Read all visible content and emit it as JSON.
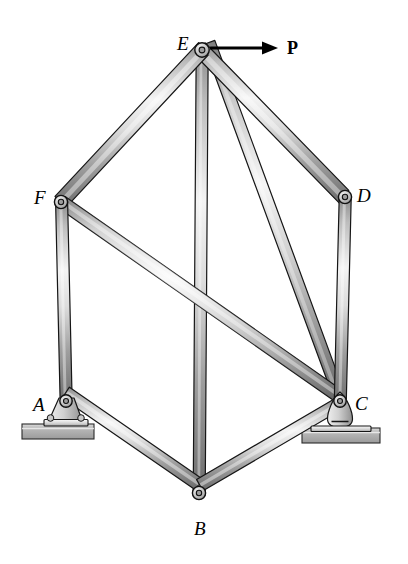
{
  "figure": {
    "type": "engineering-truss-diagram",
    "background_color": "#ffffff",
    "width": 408,
    "height": 564
  },
  "joints": [
    {
      "id": "A",
      "label": "A",
      "x": 66,
      "y": 403,
      "label_x": 33,
      "label_y": 395,
      "support": "pin"
    },
    {
      "id": "B",
      "label": "B",
      "x": 199,
      "y": 495,
      "label_x": 194,
      "label_y": 519,
      "support": "none"
    },
    {
      "id": "C",
      "label": "C",
      "x": 340,
      "y": 405,
      "label_x": 355,
      "label_y": 394,
      "support": "rocker"
    },
    {
      "id": "D",
      "label": "D",
      "x": 345,
      "y": 197,
      "label_x": 357,
      "label_y": 186,
      "support": "none"
    },
    {
      "id": "E",
      "label": "E",
      "x": 202,
      "y": 50,
      "label_x": 177,
      "label_y": 34,
      "support": "none"
    },
    {
      "id": "F",
      "label": "F",
      "x": 61,
      "y": 202,
      "label_x": 34,
      "label_y": 188,
      "support": "none"
    }
  ],
  "members": [
    {
      "id": "EF",
      "from": "E",
      "to": "F",
      "width": 13
    },
    {
      "id": "ED",
      "from": "E",
      "to": "D",
      "width": 13
    },
    {
      "id": "EB",
      "from": "E",
      "to": "B",
      "width": 12
    },
    {
      "id": "EC",
      "from": "E",
      "to": "C",
      "width": 12
    },
    {
      "id": "FA",
      "from": "F",
      "to": "A",
      "width": 12
    },
    {
      "id": "FC",
      "from": "F",
      "to": "C",
      "width": 13
    },
    {
      "id": "DC",
      "from": "D",
      "to": "C",
      "width": 12
    },
    {
      "id": "AB",
      "from": "A",
      "to": "B",
      "width": 12
    },
    {
      "id": "BC",
      "from": "B",
      "to": "C",
      "width": 12
    }
  ],
  "load": {
    "name": "P",
    "label": "P",
    "applied_at": "E",
    "direction": "horizontal-right",
    "arrow_start_x": 210,
    "arrow_start_y": 48,
    "arrow_end_x": 277,
    "arrow_end_y": 48,
    "label_x": 287,
    "label_y": 39
  },
  "supports": [
    {
      "at": "A",
      "kind": "pin",
      "ground_x": 22,
      "ground_y": 424,
      "ground_width": 72,
      "ground_height": 15
    },
    {
      "at": "C",
      "kind": "rocker",
      "ground_x": 302,
      "ground_y": 428,
      "ground_width": 78,
      "ground_height": 15
    }
  ],
  "colors": {
    "outline": "#111111",
    "bar_light": "#f2f2f2",
    "bar_mid": "#b8b8b8",
    "bar_dark": "#6e6e6e",
    "bar_edge": "#8a8a8a",
    "ground_fill": "#a9a9a9",
    "ground_top": "#d8d8d8",
    "pin_fill": "#cfcfcf",
    "pin_hole": "#9a9a9a",
    "label_color": "#000000"
  }
}
